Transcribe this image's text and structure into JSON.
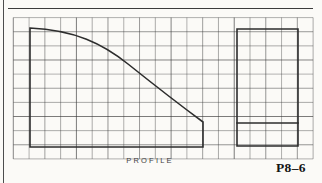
{
  "page": {
    "background": "#fbfaf7",
    "edge_line_color": "#4d4d4d",
    "top_line_color": "#3c3c3c",
    "view_label_color": "#3f3f3f",
    "figure_number_color": "#141414"
  },
  "labels": {
    "view_label": "PROFILE",
    "figure_number": "P8–6"
  },
  "drawing": {
    "grid": {
      "x": 13.3,
      "y": 17.6,
      "cols": 19,
      "rows": 10,
      "cell_w": 15.78,
      "cell_h": 14.13,
      "line_color": "#3a3a3a",
      "line_width": 0.75,
      "line_opacities": [
        0.52,
        0.68,
        0.55,
        0.82,
        0.5,
        0.63,
        0.57,
        0.88,
        0.54,
        0.7
      ]
    },
    "outline_color": "#2d2d2d",
    "outline_width": 1.6,
    "shapes": [
      {
        "name": "profile-outline",
        "path": "M 30 28 C 75 30 103 44 128 64 S 180 105 203 122 L 203 147 L 30 147 Z"
      },
      {
        "name": "side-view-rectangle",
        "path": "M 237 29 L 298 29 L 298 146 L 237 146 Z"
      },
      {
        "name": "side-view-divider-line",
        "path": "M 237 123 L 298 123"
      }
    ]
  }
}
